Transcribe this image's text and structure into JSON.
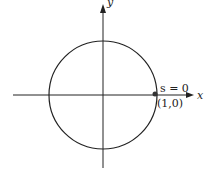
{
  "diagram": {
    "x_axis_label": "x",
    "y_axis_label": "y",
    "point_label": "s = 0",
    "point_coord": "(1,0)",
    "circle": {
      "cx": 103,
      "cy": 95,
      "r": 54
    },
    "colors": {
      "stroke": "#222222",
      "background": "#ffffff"
    }
  }
}
